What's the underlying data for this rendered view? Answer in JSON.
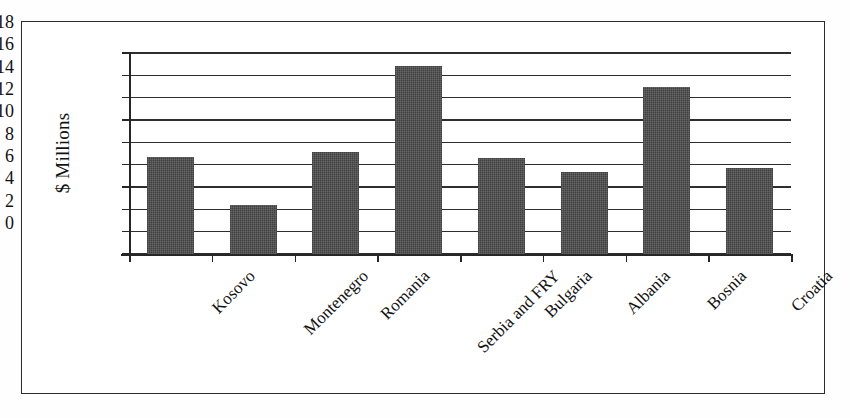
{
  "chart_data": {
    "type": "bar",
    "title": "",
    "subtitle": "",
    "xlabel": "",
    "ylabel": "$ Millions",
    "ylim": [
      0,
      18
    ],
    "ytick_step": 2,
    "yticks": [
      "18",
      "16",
      "14",
      "12",
      "10",
      "8",
      "6",
      "4",
      "2",
      "0"
    ],
    "grid": true,
    "legend": "none",
    "categories": [
      "Kosovo",
      "Montenegro",
      "Romania",
      "Serbia and FRY",
      "Bulgaria",
      "Albania",
      "Bosnia",
      "Croatia"
    ],
    "values": [
      8.7,
      4.4,
      9.1,
      16.8,
      8.6,
      7.3,
      15.0,
      7.7
    ],
    "bar_color": "#4a4a4a",
    "axis_color": "#262626",
    "background_color": "#ffffff",
    "label_rotation_degrees": -45
  },
  "figure": {
    "frame_border_color": "#2b2b2b",
    "page_background": "#fefefe"
  }
}
